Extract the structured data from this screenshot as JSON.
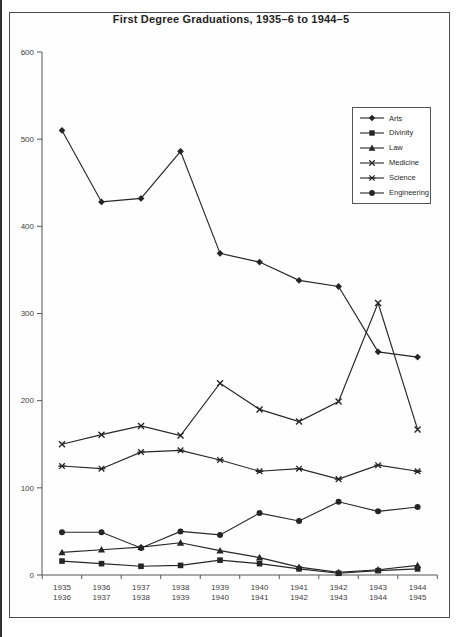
{
  "page": {
    "title": "First Degree Graduations, 1935–6 to 1944–5"
  },
  "chart_data": {
    "type": "line",
    "title": "First Degree Graduations, 1935–6 to 1944–5",
    "xlabel": "",
    "ylabel": "",
    "ylim": [
      0,
      600
    ],
    "y_ticks": [
      0,
      100,
      200,
      300,
      400,
      500,
      600
    ],
    "grid": false,
    "legend_position": "top-right",
    "line_color": "#262626",
    "text_color": "#3d3d3d",
    "categories": [
      {
        "line1": "1935",
        "line2": "1936"
      },
      {
        "line1": "1936",
        "line2": "1937"
      },
      {
        "line1": "1937",
        "line2": "1938"
      },
      {
        "line1": "1938",
        "line2": "1939"
      },
      {
        "line1": "1939",
        "line2": "1940"
      },
      {
        "line1": "1940",
        "line2": "1941"
      },
      {
        "line1": "1941",
        "line2": "1942"
      },
      {
        "line1": "1942",
        "line2": "1943"
      },
      {
        "line1": "1943",
        "line2": "1944"
      },
      {
        "line1": "1944",
        "line2": "1945"
      }
    ],
    "series": [
      {
        "name": "Arts",
        "marker": "diamond",
        "values": [
          510,
          428,
          432,
          486,
          369,
          359,
          338,
          331,
          256,
          250
        ]
      },
      {
        "name": "Divinity",
        "marker": "square",
        "values": [
          16,
          13,
          10,
          11,
          17,
          13,
          7,
          2,
          5,
          7
        ]
      },
      {
        "name": "Law",
        "marker": "triangle",
        "values": [
          26,
          29,
          32,
          37,
          28,
          20,
          9,
          3,
          6,
          11
        ]
      },
      {
        "name": "Medicine",
        "marker": "x",
        "values": [
          150,
          161,
          171,
          160,
          220,
          190,
          176,
          199,
          312,
          167
        ]
      },
      {
        "name": "Science",
        "marker": "star",
        "values": [
          125,
          122,
          141,
          143,
          132,
          119,
          122,
          110,
          126,
          119
        ]
      },
      {
        "name": "Engineering",
        "marker": "circle",
        "values": [
          49,
          49,
          31,
          50,
          46,
          71,
          62,
          84,
          73,
          78
        ]
      }
    ]
  }
}
